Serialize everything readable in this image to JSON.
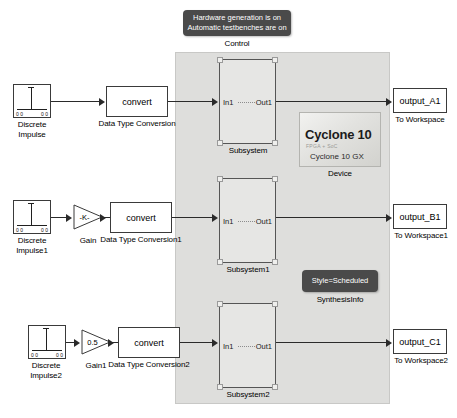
{
  "diagram": {
    "panel": {
      "name": "hardware-subsystem-panel",
      "fill": "#dededc"
    },
    "control": {
      "note_text": "Hardware generation is on\nAutomatic testbenches are on",
      "label": "Control"
    },
    "device": {
      "title": "Cyclone 10",
      "subtitle": "FPGA + SoC",
      "model": "Cyclone 10 GX",
      "label": "Device"
    },
    "synthesis": {
      "note_text": "Style=Scheduled",
      "label": "SynthesisInfo"
    },
    "rows": [
      {
        "source": {
          "label": "Discrete\nImpulse",
          "tick_left": "0 0",
          "tick_right": "0 0"
        },
        "gain": null,
        "convert": {
          "text": "convert",
          "label": "Data Type Conversion"
        },
        "subsystem": {
          "in_port": "In1",
          "out_port": "Out1",
          "label": "Subsystem"
        },
        "sink": {
          "text": "output_A1",
          "label": "To Workspace"
        }
      },
      {
        "source": {
          "label": "Discrete\nImpulse1",
          "tick_left": "0 0",
          "tick_right": "0 0"
        },
        "gain": {
          "text": "-K-",
          "label": "Gain"
        },
        "convert": {
          "text": "convert",
          "label": "Data Type Conversion1"
        },
        "subsystem": {
          "in_port": "In1",
          "out_port": "Out1",
          "label": "Subsystem1"
        },
        "sink": {
          "text": "output_B1",
          "label": "To Workspace1"
        }
      },
      {
        "source": {
          "label": "Discrete\nImpulse2",
          "tick_left": "0 0",
          "tick_right": "0 0"
        },
        "gain": {
          "text": "0.5",
          "label": "Gain1"
        },
        "convert": {
          "text": "convert",
          "label": "Data Type Conversion2"
        },
        "subsystem": {
          "in_port": "In1",
          "out_port": "Out1",
          "label": "Subsystem2"
        },
        "sink": {
          "text": "output_C1",
          "label": "To Workspace2"
        }
      }
    ]
  }
}
